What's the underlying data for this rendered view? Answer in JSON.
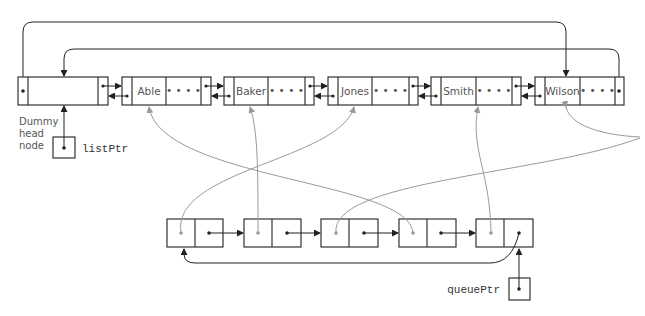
{
  "diagram": {
    "title_fragment": "",
    "dummy_label_lines": [
      "Dummy",
      "head",
      "node"
    ],
    "list_ptr_label": "listPtr",
    "queue_ptr_label": "queuePtr",
    "ellipsis": "• • • •",
    "list_nodes": [
      {
        "name": "Able"
      },
      {
        "name": "Baker"
      },
      {
        "name": "Jones"
      },
      {
        "name": "Smith"
      },
      {
        "name": "Wilson"
      }
    ],
    "queue_nodes_count": 5,
    "queue_pointers": [
      {
        "queue_index": 1,
        "points_to": "Jones"
      },
      {
        "queue_index": 2,
        "points_to": "Baker"
      },
      {
        "queue_index": 3,
        "points_to": "Wilson"
      },
      {
        "queue_index": 4,
        "points_to": "Able"
      },
      {
        "queue_index": 5,
        "points_to": "Smith"
      }
    ],
    "colors": {
      "line": "#222222",
      "gray_pointer": "#9a9a9a",
      "text": "#555555"
    }
  }
}
